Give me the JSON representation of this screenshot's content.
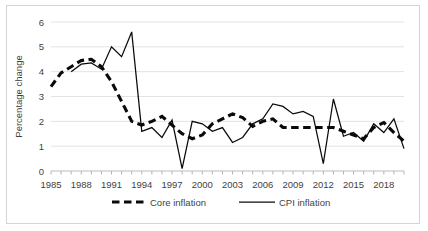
{
  "chart_data": {
    "type": "line",
    "title": "",
    "xlabel": "",
    "ylabel": "Percentage change",
    "xlim": [
      1985,
      2020
    ],
    "ylim": [
      0,
      6
    ],
    "grid": true,
    "legend_position": "bottom",
    "y_ticks": [
      "0",
      "1",
      "2",
      "3",
      "4",
      "5",
      "6"
    ],
    "x_tick_labels": [
      "1985",
      "1988",
      "1991",
      "1994",
      "1997",
      "2000",
      "2003",
      "2006",
      "2009",
      "2012",
      "2015",
      "2018"
    ],
    "x_tick_years": [
      1985,
      1988,
      1991,
      1994,
      1997,
      2000,
      2003,
      2006,
      2009,
      2012,
      2015,
      2018
    ],
    "x": [
      1985,
      1986,
      1987,
      1988,
      1989,
      1990,
      1991,
      1992,
      1993,
      1994,
      1995,
      1996,
      1997,
      1998,
      1999,
      2000,
      2001,
      2002,
      2003,
      2004,
      2005,
      2006,
      2007,
      2008,
      2009,
      2010,
      2011,
      2012,
      2013,
      2014,
      2015,
      2016,
      2017,
      2018,
      2019,
      2020
    ],
    "series": [
      {
        "name": "Core inflation",
        "style": "dashed",
        "color": "#0a0a0a",
        "x": [
          1985,
          1986,
          1987,
          1988,
          1989,
          1990,
          1991,
          1992,
          1993,
          1994,
          1995,
          1996,
          1997,
          1998,
          1999,
          2000,
          2001,
          2002,
          2003,
          2004,
          2005,
          2006,
          2007,
          2008,
          2009,
          2010,
          2011,
          2012,
          2013,
          2014,
          2015,
          2016,
          2017,
          2018,
          2019,
          2020
        ],
        "values": [
          3.4,
          3.95,
          4.2,
          4.45,
          4.5,
          4.2,
          3.6,
          2.8,
          2.0,
          1.85,
          2.0,
          2.2,
          1.85,
          1.5,
          1.3,
          1.45,
          1.9,
          2.1,
          2.3,
          2.15,
          1.8,
          2.0,
          2.1,
          1.75,
          1.75,
          1.75,
          1.75,
          1.75,
          1.75,
          1.6,
          1.45,
          1.3,
          1.75,
          1.95,
          1.55,
          1.2
        ]
      },
      {
        "name": "CPI inflation",
        "style": "solid",
        "color": "#0a0a0a",
        "x": [
          1987,
          1988,
          1989,
          1990,
          1991,
          1992,
          1993,
          1994,
          1995,
          1996,
          1997,
          1998,
          1999,
          2000,
          2001,
          2002,
          2003,
          2004,
          2005,
          2006,
          2007,
          2008,
          2009,
          2010,
          2011,
          2012,
          2013,
          2014,
          2015,
          2016,
          2017,
          2018,
          2019,
          2020
        ],
        "values": [
          4.0,
          4.3,
          4.35,
          4.1,
          5.0,
          4.6,
          5.6,
          1.6,
          1.75,
          1.35,
          2.05,
          0.1,
          2.0,
          1.9,
          1.6,
          1.75,
          1.15,
          1.35,
          1.9,
          2.1,
          2.7,
          2.6,
          2.3,
          2.4,
          2.2,
          0.3,
          2.9,
          1.4,
          1.55,
          1.2,
          1.9,
          1.55,
          2.1,
          0.9
        ]
      }
    ]
  },
  "legend": {
    "items": [
      {
        "label": "Core inflation",
        "style": "dashed"
      },
      {
        "label": "CPI inflation",
        "style": "solid"
      }
    ]
  }
}
